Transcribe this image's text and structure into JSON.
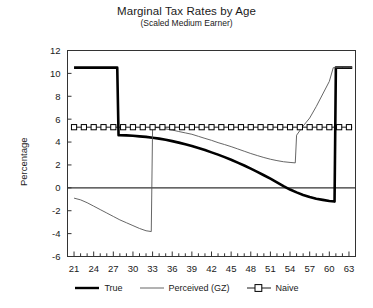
{
  "chart_data": {
    "type": "line",
    "title": "Marginal Tax Rates by Age",
    "subtitle": "(Scaled Medium Earner)",
    "xlabel": "",
    "ylabel": "Percentage",
    "xlim": [
      20,
      64
    ],
    "ylim": [
      -6,
      12
    ],
    "yticks": [
      12,
      10,
      8,
      6,
      4,
      2,
      0,
      -2,
      -4,
      -6
    ],
    "ytick_labels": [
      "12",
      "10",
      "8",
      "6",
      "4",
      "2",
      "0",
      "-2",
      "-4",
      "-6"
    ],
    "xticks": [
      21,
      24,
      27,
      30,
      33,
      36,
      39,
      42,
      45,
      48,
      51,
      54,
      57,
      60,
      63
    ],
    "xtick_labels": [
      "21",
      "24",
      "27",
      "30",
      "33",
      "36",
      "39",
      "42",
      "45",
      "48",
      "51",
      "54",
      "57",
      "60",
      "63"
    ],
    "x_minor_tick_step": 1,
    "grid": false,
    "zero_line": 0,
    "legend_position": "below",
    "series": [
      {
        "name": "True",
        "style": "thick-solid",
        "color": "#000000",
        "points": [
          [
            21,
            10.5
          ],
          [
            22,
            10.5
          ],
          [
            23,
            10.5
          ],
          [
            24,
            10.5
          ],
          [
            25,
            10.5
          ],
          [
            26,
            10.5
          ],
          [
            27,
            10.5
          ],
          [
            27.6,
            10.5
          ],
          [
            27.8,
            4.6
          ],
          [
            28,
            4.6
          ],
          [
            29,
            4.58
          ],
          [
            30,
            4.55
          ],
          [
            31,
            4.5
          ],
          [
            32,
            4.45
          ],
          [
            33,
            4.38
          ],
          [
            34,
            4.3
          ],
          [
            35,
            4.2
          ],
          [
            36,
            4.08
          ],
          [
            37,
            3.95
          ],
          [
            38,
            3.8
          ],
          [
            39,
            3.65
          ],
          [
            40,
            3.48
          ],
          [
            41,
            3.3
          ],
          [
            42,
            3.1
          ],
          [
            43,
            2.9
          ],
          [
            44,
            2.68
          ],
          [
            45,
            2.45
          ],
          [
            46,
            2.2
          ],
          [
            47,
            1.95
          ],
          [
            48,
            1.68
          ],
          [
            49,
            1.4
          ],
          [
            50,
            1.1
          ],
          [
            51,
            0.8
          ],
          [
            52,
            0.48
          ],
          [
            53,
            0.15
          ],
          [
            54,
            -0.15
          ],
          [
            55,
            -0.4
          ],
          [
            56,
            -0.62
          ],
          [
            57,
            -0.8
          ],
          [
            58,
            -0.95
          ],
          [
            59,
            -1.05
          ],
          [
            60,
            -1.15
          ],
          [
            60.8,
            -1.2
          ],
          [
            61,
            10.5
          ],
          [
            62,
            10.5
          ],
          [
            63,
            10.5
          ],
          [
            63.5,
            10.5
          ]
        ]
      },
      {
        "name": "Perceived (GZ)",
        "style": "thin-solid",
        "color": "#555555",
        "points": [
          [
            21,
            -0.9
          ],
          [
            22,
            -1.05
          ],
          [
            23,
            -1.3
          ],
          [
            24,
            -1.6
          ],
          [
            25,
            -1.9
          ],
          [
            26,
            -2.2
          ],
          [
            27,
            -2.5
          ],
          [
            28,
            -2.8
          ],
          [
            29,
            -3.05
          ],
          [
            30,
            -3.3
          ],
          [
            31,
            -3.55
          ],
          [
            32,
            -3.75
          ],
          [
            32.8,
            -3.82
          ],
          [
            33,
            5.3
          ],
          [
            34,
            5.25
          ],
          [
            35,
            5.15
          ],
          [
            36,
            5.05
          ],
          [
            37,
            4.92
          ],
          [
            38,
            4.8
          ],
          [
            39,
            4.68
          ],
          [
            40,
            4.5
          ],
          [
            41,
            4.32
          ],
          [
            42,
            4.15
          ],
          [
            43,
            3.95
          ],
          [
            44,
            3.78
          ],
          [
            45,
            3.6
          ],
          [
            46,
            3.4
          ],
          [
            47,
            3.2
          ],
          [
            48,
            3.0
          ],
          [
            49,
            2.82
          ],
          [
            50,
            2.65
          ],
          [
            51,
            2.5
          ],
          [
            52,
            2.38
          ],
          [
            53,
            2.28
          ],
          [
            54,
            2.22
          ],
          [
            54.8,
            2.18
          ],
          [
            55,
            4.6
          ],
          [
            55.5,
            5.0
          ],
          [
            56,
            5.4
          ],
          [
            57,
            6.1
          ],
          [
            58,
            7.1
          ],
          [
            59,
            8.2
          ],
          [
            60,
            9.3
          ],
          [
            60.6,
            10.5
          ],
          [
            61,
            10.5
          ],
          [
            62,
            10.5
          ],
          [
            63,
            10.5
          ],
          [
            63.5,
            10.5
          ]
        ]
      },
      {
        "name": "Naive",
        "style": "square-markers",
        "color": "#000000",
        "constant_value": 5.3,
        "marker_x": [
          21,
          22.5,
          24,
          25.5,
          27,
          28.5,
          30,
          31.5,
          33,
          34.5,
          36,
          37.5,
          39,
          40.5,
          42,
          43.5,
          45,
          46.5,
          48,
          49.5,
          51,
          52.5,
          54,
          55.5,
          57,
          58.5,
          60,
          61.5,
          63
        ],
        "points": [
          [
            21,
            5.3
          ],
          [
            63.5,
            5.3
          ]
        ]
      }
    ]
  },
  "legend": {
    "entries": [
      {
        "label": "True"
      },
      {
        "label": "Perceived (GZ)"
      },
      {
        "label": "Naive"
      }
    ]
  }
}
